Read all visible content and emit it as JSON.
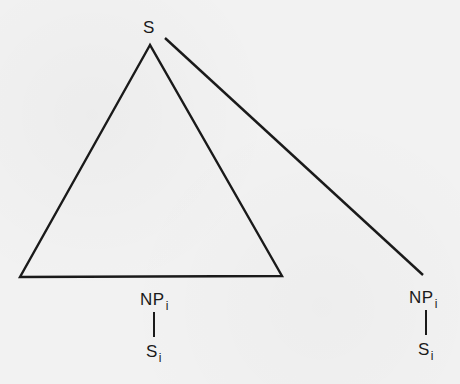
{
  "diagram": {
    "type": "syntax-tree",
    "root": {
      "label": "S",
      "subscript": ""
    },
    "triangle": {
      "description": "Triangle under S spanning a constituent"
    },
    "left_np": {
      "label": "NP",
      "subscript": "i"
    },
    "left_s": {
      "label": "S",
      "subscript": "i"
    },
    "right_np": {
      "label": "NP",
      "subscript": "i"
    },
    "right_s": {
      "label": "S",
      "subscript": "i"
    },
    "colors": {
      "line": "#1a1a1a",
      "background": "#f2f2f2"
    }
  }
}
